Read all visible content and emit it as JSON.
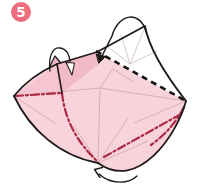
{
  "step": {
    "number": "5"
  },
  "colors": {
    "background": "#ffffff",
    "badge_fill": "#ee6d7d",
    "badge_stroke": "#e35e6f",
    "badge_text": "#ffffff",
    "paper_front": "#f9d3db",
    "paper_shade_left": "#f5c6d1",
    "paper_shade_top": "#f1bac7",
    "paper_flap_back": "#efb3c2",
    "paper_back": "#ffffff",
    "outline": "#201a1a",
    "valley_fold": "#171412",
    "mountain_fold": "#ab2942",
    "crease_pink": "#cf9fa9",
    "crease_white": "#c6bcb8"
  },
  "legend": {
    "mountain_fold_style": "red dash-dot line",
    "valley_fold_style": "black dashed line",
    "crease_style": "thin light fold line"
  },
  "arrows": [
    {
      "name": "fold-over-arrow-top-left",
      "head": "open"
    },
    {
      "name": "fold-down-arrow-top-right",
      "head": "solid"
    },
    {
      "name": "fold-corner-arrow-bottom",
      "head": "open-v"
    }
  ]
}
